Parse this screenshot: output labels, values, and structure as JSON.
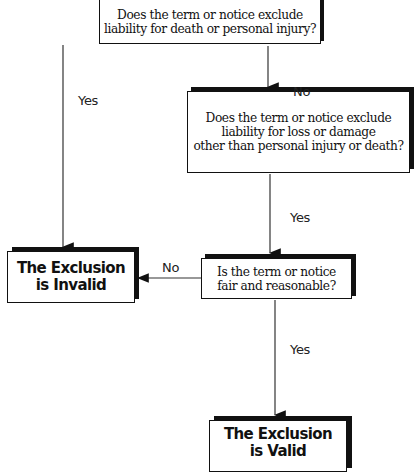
{
  "diagram": {
    "nodes": {
      "q1": {
        "lines": [
          "Does the term or notice exclude",
          "liability for death or personal injury?"
        ]
      },
      "q2": {
        "lines": [
          "Does the term or notice exclude",
          "liability for loss or damage",
          "other than personal injury or death?"
        ]
      },
      "q3": {
        "lines": [
          "Is the term or notice",
          "fair and reasonable?"
        ]
      },
      "invalid": {
        "lines": [
          "The Exclusion",
          "is Invalid"
        ]
      },
      "valid": {
        "lines": [
          "The Exclusion",
          "is Valid"
        ]
      }
    },
    "edges": [
      {
        "from": "q1",
        "to": "invalid",
        "label": "Yes"
      },
      {
        "from": "q1",
        "to": "q2",
        "label": "No"
      },
      {
        "from": "q2",
        "to": "q3",
        "label": "Yes"
      },
      {
        "from": "q3",
        "to": "invalid",
        "label": "No"
      },
      {
        "from": "q3",
        "to": "valid",
        "label": "Yes"
      }
    ]
  }
}
